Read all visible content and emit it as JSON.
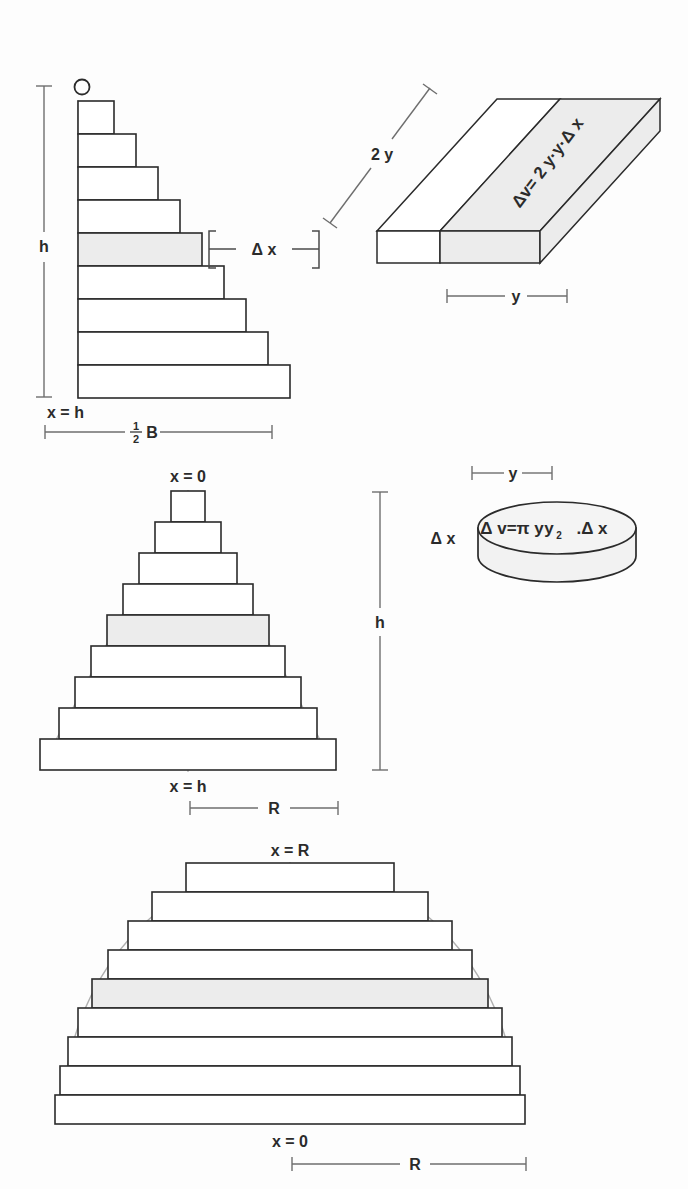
{
  "figure": {
    "background_color": "#fdfdfd",
    "ink_color": "#2b2b2b",
    "shade_color": "#ececec",
    "guide_color": "#9a9a9a"
  },
  "panels": [
    {
      "id": "pyramid-cross-section",
      "name": "Pyramid half cross-section staircase",
      "labels": {
        "apex": "O",
        "base_left": "x = h",
        "height": "h",
        "base_width": "B",
        "base_width_fraction_numerator": "1",
        "base_width_fraction_denominator": "2",
        "slab_thickness": "Δ x"
      },
      "steps": 9,
      "shaded_step_index": 5
    },
    {
      "id": "slab-element",
      "name": "Rectangular slab volume element",
      "labels": {
        "long_edge": "2 y",
        "short_edge": "y",
        "volume_formula": "Δv= 2 y·y·Δ x"
      }
    },
    {
      "id": "cone-cross-section",
      "name": "Cone cross-section staircase",
      "labels": {
        "apex": "x = 0",
        "base": "x = h",
        "height": "h",
        "radius": "R"
      },
      "steps": 9,
      "shaded_step_index": 5
    },
    {
      "id": "disc-element",
      "name": "Circular disc volume element",
      "labels": {
        "radius": "y",
        "thickness": "Δ x",
        "volume_formula_head": "Δ v=π y",
        "volume_formula_sub": "2",
        "volume_formula_tail": ".Δ x"
      }
    },
    {
      "id": "hemisphere-cross-section",
      "name": "Hemisphere cross-section staircase",
      "labels": {
        "top": "x = R",
        "base": "x = 0",
        "radius": "R"
      },
      "steps": 9,
      "shaded_step_index": 5
    }
  ]
}
